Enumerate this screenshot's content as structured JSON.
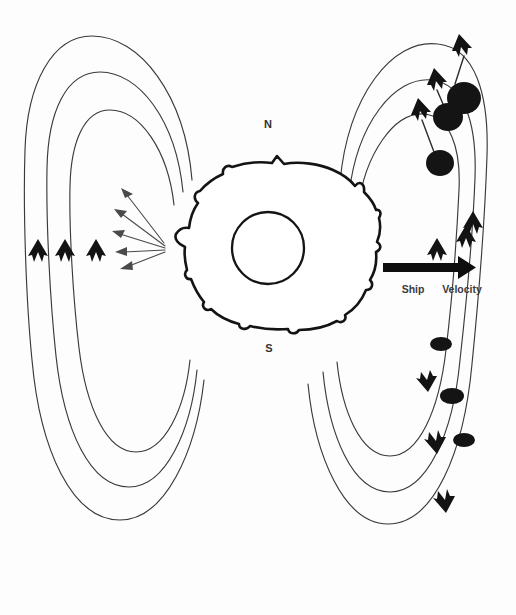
{
  "figure": {
    "background_color": "#fdfdfd",
    "stroke_color": "#3a3a3a",
    "ink_color": "#141414",
    "width": 516,
    "height": 615
  },
  "labels": {
    "north_pole": "N",
    "south_pole": "S",
    "ship": "Ship",
    "velocity": "Velocity"
  },
  "central_body": {
    "name": "planet-body",
    "shape": "irregular-blob",
    "core": "inner-circle",
    "center_x": 268,
    "center_y": 248,
    "core_radius": 36
  },
  "field_lines": {
    "left_lobe_count": 3,
    "right_lobe_count": 3,
    "left_direction": "inbound-upward",
    "right_direction": "outbound-upward-top, inbound-downward-bottom"
  },
  "left_chevrons": [
    {
      "name": "chevron-left-1",
      "x": 38,
      "y": 250,
      "direction": "up"
    },
    {
      "name": "chevron-left-2",
      "x": 65,
      "y": 250,
      "direction": "up"
    },
    {
      "name": "chevron-left-3",
      "x": 96,
      "y": 250,
      "direction": "up"
    }
  ],
  "right_chevrons_up": [
    {
      "name": "chevron-right-up-1",
      "x": 437,
      "y": 249,
      "direction": "up"
    },
    {
      "name": "chevron-right-up-2",
      "x": 466,
      "y": 236,
      "direction": "up"
    },
    {
      "name": "chevron-right-up-3",
      "x": 472,
      "y": 222,
      "direction": "up"
    },
    {
      "name": "chevron-right-up-4",
      "x": 421,
      "y": 108,
      "direction": "up"
    },
    {
      "name": "chevron-right-up-5",
      "x": 436,
      "y": 78,
      "direction": "up"
    },
    {
      "name": "chevron-right-up-6",
      "x": 461,
      "y": 44,
      "direction": "up"
    }
  ],
  "right_chevrons_down": [
    {
      "name": "chevron-right-down-1",
      "x": 430,
      "y": 382,
      "direction": "down"
    },
    {
      "name": "chevron-right-down-2",
      "x": 438,
      "y": 444,
      "direction": "down"
    },
    {
      "name": "chevron-right-down-3",
      "x": 446,
      "y": 503,
      "direction": "down"
    }
  ],
  "particles_upper": [
    {
      "name": "particle-upper-1",
      "cx": 464,
      "cy": 98,
      "rx": 17,
      "ry": 16
    },
    {
      "name": "particle-upper-2",
      "cx": 448,
      "cy": 117,
      "rx": 15,
      "ry": 14
    },
    {
      "name": "particle-upper-3",
      "cx": 440,
      "cy": 163,
      "rx": 14,
      "ry": 13
    }
  ],
  "particles_lower": [
    {
      "name": "particle-lower-1",
      "cx": 441,
      "cy": 344,
      "rx": 11,
      "ry": 7
    },
    {
      "name": "particle-lower-2",
      "cx": 452,
      "cy": 396,
      "rx": 12,
      "ry": 8
    },
    {
      "name": "particle-lower-3",
      "cx": 464,
      "cy": 440,
      "rx": 11,
      "ry": 7
    }
  ],
  "emission_arrows": {
    "count": 5,
    "origin_x": 163,
    "origin_y": 245,
    "direction": "radiating-left",
    "tips": [
      {
        "x": 122,
        "y": 192
      },
      {
        "x": 115,
        "y": 212
      },
      {
        "x": 113,
        "y": 232
      },
      {
        "x": 116,
        "y": 250
      },
      {
        "x": 121,
        "y": 264
      }
    ]
  },
  "ship_velocity_arrow": {
    "name": "ship-velocity-arrow",
    "x_start": 383,
    "x_end": 474,
    "y": 267,
    "direction": "right",
    "thickness": 9
  }
}
